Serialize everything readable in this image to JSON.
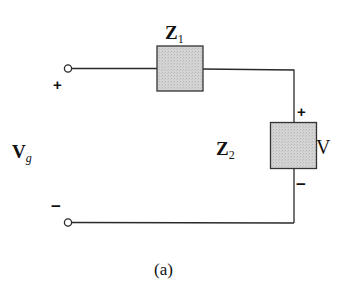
{
  "diagram": {
    "type": "circuit",
    "caption": "(a)",
    "source_label": {
      "main": "V",
      "sub": "g"
    },
    "components": [
      {
        "id": "Z1",
        "main": "Z",
        "sub": "1",
        "kind": "impedance",
        "orientation": "horizontal"
      },
      {
        "id": "Z2",
        "main": "Z",
        "sub": "2",
        "kind": "impedance",
        "orientation": "vertical"
      }
    ],
    "output_voltage": {
      "label": "V",
      "positive": "+",
      "negative": "−"
    },
    "terminals": {
      "positive": "+",
      "negative": "−"
    },
    "colors": {
      "wire": "#2a2a2a",
      "box_fill": "#cfcfcf",
      "box_stroke": "#333333"
    }
  }
}
